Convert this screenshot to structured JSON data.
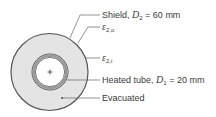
{
  "diagram": {
    "labels": {
      "shield": {
        "text": "Shield, ",
        "var": "D",
        "sub": "2",
        "value": " = 60 mm"
      },
      "eps_outer": {
        "var": "ε",
        "sub": "2,o"
      },
      "eps_inner": {
        "var": "ε",
        "sub": "2,i"
      },
      "tube": {
        "text": "Heated tube, ",
        "var": "D",
        "sub": "1",
        "value": " = 20 mm"
      },
      "evacuated": {
        "text": "Evacuated"
      }
    },
    "colors": {
      "annulus_fill": "#e4e4e4",
      "outline": "#555555",
      "tube_wall": "#8a8a8a",
      "leader": "#666666"
    }
  }
}
